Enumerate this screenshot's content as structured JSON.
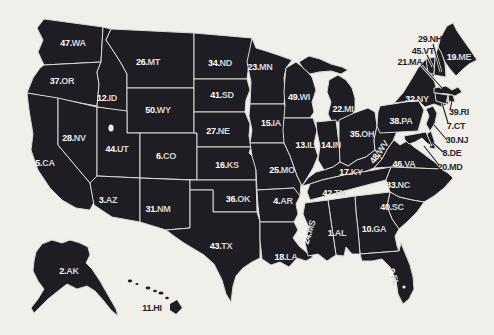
{
  "map": {
    "name": "United States map with states numbered in alphabetical order",
    "colors": {
      "background": "#f1efea",
      "land_fill": "#1d1d23",
      "border": "#dbd9d2",
      "label_number": "#ffffff",
      "label_abbr": "#d4d4d4",
      "label_dark": "#1d1d23"
    },
    "states": [
      {
        "num": "1",
        "abbr": "AL",
        "x": 337,
        "y": 233
      },
      {
        "num": "2",
        "abbr": "AK",
        "x": 69,
        "y": 271
      },
      {
        "num": "3",
        "abbr": "AZ",
        "x": 108,
        "y": 200
      },
      {
        "num": "4",
        "abbr": "AR",
        "x": 283,
        "y": 201
      },
      {
        "num": "5",
        "abbr": "CA",
        "x": 45,
        "y": 163
      },
      {
        "num": "6",
        "abbr": "CO",
        "x": 166,
        "y": 156
      },
      {
        "num": "7",
        "abbr": "CT",
        "x": 456,
        "y": 126,
        "dark": true,
        "line": [
          448,
          123,
          442,
          103
        ]
      },
      {
        "num": "8",
        "abbr": "DE",
        "x": 452,
        "y": 153,
        "dark": true,
        "line": [
          443,
          152,
          433,
          143
        ]
      },
      {
        "num": "9",
        "abbr": "FL",
        "x": 394,
        "y": 277,
        "rot": 72
      },
      {
        "num": "10",
        "abbr": "GA",
        "x": 374,
        "y": 229
      },
      {
        "num": "11",
        "abbr": "HI",
        "x": 152,
        "y": 308,
        "dark": true
      },
      {
        "num": "12",
        "abbr": "ID",
        "x": 107,
        "y": 98
      },
      {
        "num": "13",
        "abbr": "IL",
        "x": 305,
        "y": 145
      },
      {
        "num": "14",
        "abbr": "IN",
        "x": 331,
        "y": 145
      },
      {
        "num": "15",
        "abbr": "IA",
        "x": 271,
        "y": 123
      },
      {
        "num": "16",
        "abbr": "KS",
        "x": 227,
        "y": 165
      },
      {
        "num": "17",
        "abbr": "KY",
        "x": 351,
        "y": 172
      },
      {
        "num": "18",
        "abbr": "LA",
        "x": 286,
        "y": 257
      },
      {
        "num": "19",
        "abbr": "ME",
        "x": 459,
        "y": 57
      },
      {
        "num": "20",
        "abbr": "MD",
        "x": 450,
        "y": 167,
        "dark": true,
        "line": [
          439,
          165,
          424,
          146
        ]
      },
      {
        "num": "21",
        "abbr": "MA",
        "x": 410,
        "y": 62,
        "dark": true,
        "line": [
          421,
          65,
          442,
          88
        ]
      },
      {
        "num": "22",
        "abbr": "MI",
        "x": 343,
        "y": 109
      },
      {
        "num": "23",
        "abbr": "MN",
        "x": 260,
        "y": 67
      },
      {
        "num": "24",
        "abbr": "MS",
        "x": 309,
        "y": 232,
        "rot": -72
      },
      {
        "num": "25",
        "abbr": "MO",
        "x": 282,
        "y": 170
      },
      {
        "num": "26",
        "abbr": "MT",
        "x": 148,
        "y": 62
      },
      {
        "num": "27",
        "abbr": "NE",
        "x": 218,
        "y": 131
      },
      {
        "num": "28",
        "abbr": "NV",
        "x": 74,
        "y": 138
      },
      {
        "num": "29",
        "abbr": "NH",
        "x": 430,
        "y": 39,
        "dark": true,
        "line": [
          433,
          44,
          441,
          72
        ]
      },
      {
        "num": "30",
        "abbr": "NJ",
        "x": 457,
        "y": 140,
        "dark": true,
        "line": [
          447,
          140,
          434,
          125
        ]
      },
      {
        "num": "31",
        "abbr": "NM",
        "x": 158,
        "y": 209
      },
      {
        "num": "32",
        "abbr": "NY",
        "x": 417,
        "y": 99
      },
      {
        "num": "33",
        "abbr": "NC",
        "x": 398,
        "y": 185
      },
      {
        "num": "34",
        "abbr": "ND",
        "x": 220,
        "y": 63
      },
      {
        "num": "35",
        "abbr": "OH",
        "x": 362,
        "y": 134
      },
      {
        "num": "36",
        "abbr": "OK",
        "x": 238,
        "y": 199
      },
      {
        "num": "37",
        "abbr": "OR",
        "x": 62,
        "y": 81
      },
      {
        "num": "38",
        "abbr": "PA",
        "x": 401,
        "y": 121
      },
      {
        "num": "39",
        "abbr": "RI",
        "x": 459,
        "y": 112,
        "dark": true,
        "line": [
          450,
          110,
          452,
          101
        ]
      },
      {
        "num": "40",
        "abbr": "SC",
        "x": 392,
        "y": 207
      },
      {
        "num": "41",
        "abbr": "SD",
        "x": 222,
        "y": 95
      },
      {
        "num": "42",
        "abbr": "TN",
        "x": 334,
        "y": 193
      },
      {
        "num": "43",
        "abbr": "TX",
        "x": 221,
        "y": 246
      },
      {
        "num": "44",
        "abbr": "UT",
        "x": 117,
        "y": 149
      },
      {
        "num": "45",
        "abbr": "VT",
        "x": 423,
        "y": 51,
        "dark": true,
        "line": [
          427,
          55,
          433,
          67
        ]
      },
      {
        "num": "46",
        "abbr": "VA",
        "x": 404,
        "y": 164
      },
      {
        "num": "47",
        "abbr": "WA",
        "x": 73,
        "y": 43
      },
      {
        "num": "48",
        "abbr": "WV",
        "x": 379,
        "y": 152,
        "rot": -55
      },
      {
        "num": "49",
        "abbr": "WI",
        "x": 299,
        "y": 97
      },
      {
        "num": "50",
        "abbr": "WY",
        "x": 158,
        "y": 110
      }
    ]
  }
}
